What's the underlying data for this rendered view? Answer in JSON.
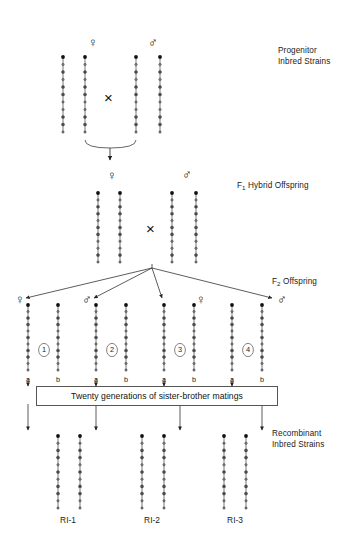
{
  "figure": {
    "background": "#ffffff",
    "line_color": "#555555",
    "marker_dark": "#111111",
    "marker_light": "#777777"
  },
  "stage_labels": [
    {
      "id": "progenitor",
      "line1": "Progenitor",
      "line2": "Inbred Strains",
      "x": 278,
      "y": 45
    },
    {
      "id": "f1",
      "prefix": "F",
      "sub": "1",
      "text": " Hybrid Offspring",
      "x": 237,
      "y": 180
    },
    {
      "id": "f2",
      "prefix": "F",
      "sub": "2",
      "text": " Offspring",
      "x": 272,
      "y": 276
    },
    {
      "id": "ri",
      "line1": "Recombinant",
      "line2": "Inbred Strains",
      "x": 272,
      "y": 428
    }
  ],
  "sex_symbols": [
    {
      "id": "p-female",
      "glyph": "♀",
      "x": 88,
      "y": 36
    },
    {
      "id": "p-male",
      "glyph": "♂",
      "x": 148,
      "y": 36
    },
    {
      "id": "f1-female",
      "glyph": "♀",
      "x": 107,
      "y": 169
    },
    {
      "id": "f1-male",
      "glyph": "♂",
      "x": 182,
      "y": 168
    },
    {
      "id": "f2-female-1",
      "glyph": "♀",
      "x": 15,
      "y": 293
    },
    {
      "id": "f2-male-2",
      "glyph": "♂",
      "x": 82,
      "y": 293
    },
    {
      "id": "f2-female-3",
      "glyph": "♀",
      "x": 196,
      "y": 293
    },
    {
      "id": "f2-male-4",
      "glyph": "♂",
      "x": 277,
      "y": 293
    }
  ],
  "cross_symbols": [
    {
      "id": "cross-progenitor",
      "glyph": "×",
      "x": 104,
      "y": 90
    },
    {
      "id": "cross-f1",
      "glyph": "×",
      "x": 146,
      "y": 221
    }
  ],
  "f2_groups": [
    {
      "number": "1",
      "circle_x": 44,
      "circle_y": 350,
      "labels": [
        "a",
        "b"
      ],
      "label_x": [
        28,
        58
      ],
      "label_y": 376
    },
    {
      "number": "2",
      "circle_x": 112,
      "circle_y": 350,
      "labels": [
        "a",
        "b"
      ],
      "label_x": [
        96,
        126
      ],
      "label_y": 376
    },
    {
      "number": "3",
      "circle_x": 180,
      "circle_y": 350,
      "labels": [
        "a",
        "b"
      ],
      "label_x": [
        164,
        194
      ],
      "label_y": 376
    },
    {
      "number": "4",
      "circle_x": 248,
      "circle_y": 350,
      "labels": [
        "a",
        "b"
      ],
      "label_x": [
        232,
        262
      ],
      "label_y": 376
    }
  ],
  "matings_box": {
    "text": "Twenty generations of sister-brother matings",
    "x": 36,
    "y": 386,
    "width": 240,
    "height": 18
  },
  "ri_strains": [
    {
      "label": "RI-1",
      "x": 68,
      "y": 516
    },
    {
      "label": "RI-2",
      "x": 152,
      "y": 516
    },
    {
      "label": "RI-3",
      "x": 235,
      "y": 516
    }
  ],
  "chromosome_sets": {
    "progenitor": {
      "y_top": 57,
      "y_bottom": 132,
      "strains": [
        {
          "x": 63,
          "pattern": "dark"
        },
        {
          "x": 85,
          "pattern": "dark"
        },
        {
          "x": 136,
          "pattern": "light"
        },
        {
          "x": 160,
          "pattern": "light"
        }
      ]
    },
    "f1": {
      "y_top": 193,
      "y_bottom": 262,
      "strains": [
        {
          "x": 98,
          "pattern": "mixed-a"
        },
        {
          "x": 120,
          "pattern": "mixed-a"
        },
        {
          "x": 172,
          "pattern": "mixed-a"
        },
        {
          "x": 196,
          "pattern": "mixed-a"
        }
      ]
    },
    "f2": {
      "y_top": 305,
      "y_bottom": 370,
      "strains": [
        {
          "x": 28,
          "pattern": "rec-1a"
        },
        {
          "x": 58,
          "pattern": "rec-1b"
        },
        {
          "x": 96,
          "pattern": "rec-2a"
        },
        {
          "x": 126,
          "pattern": "rec-2b"
        },
        {
          "x": 164,
          "pattern": "rec-3a"
        },
        {
          "x": 194,
          "pattern": "rec-3b"
        },
        {
          "x": 232,
          "pattern": "rec-4a"
        },
        {
          "x": 262,
          "pattern": "rec-4b"
        }
      ]
    },
    "ri": {
      "y_top": 436,
      "y_bottom": 508,
      "strains": [
        {
          "x": 58,
          "pattern": "ri-1a"
        },
        {
          "x": 80,
          "pattern": "ri-1b"
        },
        {
          "x": 142,
          "pattern": "ri-2a"
        },
        {
          "x": 164,
          "pattern": "ri-2b"
        },
        {
          "x": 224,
          "pattern": "ri-3a"
        },
        {
          "x": 246,
          "pattern": "ri-3b"
        }
      ]
    }
  },
  "marker_patterns": {
    "dark": [
      "D",
      "L",
      "D",
      "L",
      "D",
      "D",
      "L",
      "L",
      "D",
      "D",
      "L"
    ],
    "light": [
      "D",
      "L",
      "D",
      "L",
      "D",
      "D",
      "L",
      "L",
      "D",
      "D",
      "L"
    ],
    "mixed-a": [
      "D",
      "L",
      "D",
      "D",
      "L",
      "D",
      "D",
      "L",
      "L",
      "D",
      "L"
    ],
    "rec-1a": [
      "D",
      "L",
      "D",
      "D",
      "L",
      "D",
      "L",
      "D",
      "D",
      "L",
      "L"
    ],
    "rec-1b": [
      "D",
      "L",
      "D",
      "D",
      "L",
      "D",
      "L",
      "D",
      "D",
      "L",
      "L"
    ],
    "rec-2a": [
      "D",
      "L",
      "D",
      "D",
      "L",
      "D",
      "L",
      "D",
      "D",
      "L",
      "L"
    ],
    "rec-2b": [
      "D",
      "L",
      "D",
      "D",
      "L",
      "D",
      "L",
      "D",
      "D",
      "L",
      "L"
    ],
    "rec-3a": [
      "D",
      "L",
      "D",
      "D",
      "L",
      "D",
      "L",
      "D",
      "D",
      "L",
      "L"
    ],
    "rec-3b": [
      "D",
      "L",
      "D",
      "D",
      "L",
      "D",
      "L",
      "D",
      "D",
      "L",
      "L"
    ],
    "rec-4a": [
      "D",
      "L",
      "D",
      "D",
      "L",
      "D",
      "L",
      "D",
      "D",
      "L",
      "L"
    ],
    "rec-4b": [
      "D",
      "L",
      "D",
      "D",
      "L",
      "D",
      "L",
      "D",
      "D",
      "L",
      "L"
    ],
    "ri-1a": [
      "D",
      "L",
      "D",
      "D",
      "L",
      "D",
      "L",
      "D",
      "D",
      "L",
      "L"
    ],
    "ri-1b": [
      "D",
      "L",
      "D",
      "D",
      "L",
      "D",
      "L",
      "D",
      "D",
      "L",
      "L"
    ],
    "ri-2a": [
      "D",
      "L",
      "D",
      "D",
      "L",
      "D",
      "L",
      "D",
      "D",
      "L",
      "L"
    ],
    "ri-2b": [
      "D",
      "L",
      "D",
      "D",
      "L",
      "D",
      "L",
      "D",
      "D",
      "L",
      "L"
    ],
    "ri-3a": [
      "D",
      "L",
      "D",
      "D",
      "L",
      "D",
      "L",
      "D",
      "D",
      "L",
      "L"
    ],
    "ri-3b": [
      "D",
      "L",
      "D",
      "D",
      "L",
      "D",
      "L",
      "D",
      "D",
      "L",
      "L"
    ]
  },
  "arrows": {
    "progenitor_to_f1": {
      "from_left_x": 85,
      "from_right_x": 136,
      "bracket_y": 140,
      "down_x": 110,
      "tip_y": 160
    },
    "f1_to_f2": {
      "origin_x": 152,
      "origin_y": 268,
      "targets": [
        {
          "x": 26,
          "y": 298
        },
        {
          "x": 94,
          "y": 298
        },
        {
          "x": 162,
          "y": 298
        },
        {
          "x": 272,
          "y": 298
        }
      ]
    },
    "f2_to_box": [
      {
        "x": 28,
        "y0": 378,
        "y1": 386
      },
      {
        "x": 96,
        "y0": 378,
        "y1": 386
      },
      {
        "x": 164,
        "y0": 378,
        "y1": 386
      },
      {
        "x": 232,
        "y0": 378,
        "y1": 386
      }
    ],
    "box_to_ri": [
      {
        "x": 28,
        "y0": 404,
        "y1": 430
      },
      {
        "x": 96,
        "y0": 404,
        "y1": 430
      },
      {
        "x": 180,
        "y0": 404,
        "y1": 430
      },
      {
        "x": 262,
        "y0": 404,
        "y1": 430
      }
    ]
  }
}
